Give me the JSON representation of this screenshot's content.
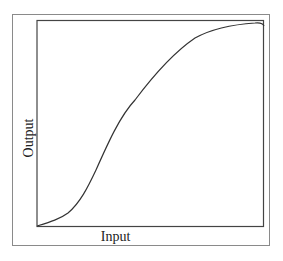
{
  "chart_data": {
    "type": "line",
    "title": "",
    "xlabel": "Input",
    "ylabel": "Output",
    "grid": false,
    "legend": null,
    "axis_ticks": false,
    "xlim": [
      0,
      1
    ],
    "ylim": [
      0,
      1
    ],
    "series": [
      {
        "name": "response",
        "x": [
          0.0,
          0.05,
          0.1,
          0.15,
          0.2,
          0.25,
          0.3,
          0.35,
          0.4,
          0.45,
          0.5,
          0.55,
          0.6,
          0.65,
          0.7,
          0.75,
          0.8,
          0.85,
          0.9,
          0.95,
          1.0
        ],
        "y": [
          0.0,
          0.03,
          0.07,
          0.14,
          0.24,
          0.35,
          0.47,
          0.58,
          0.68,
          0.75,
          0.81,
          0.86,
          0.91,
          0.94,
          0.96,
          0.97,
          0.98,
          0.985,
          0.99,
          0.995,
          0.99
        ]
      }
    ],
    "svg_path": "M37,226 C50,222 60,219 68,213 C80,203 88,187 96,170 C108,143 120,116 135,100 C150,80 170,55 195,38 C215,27 240,24 255,23 C260,22.5 263,23 264,26",
    "plot_box": {
      "x": 37,
      "y": 20,
      "width": 227,
      "height": 206
    }
  },
  "labels": {
    "x_axis": "Input",
    "y_axis": "Output"
  },
  "colors": {
    "curve": "#333333",
    "axes": "#444444",
    "frame": "#8a8a8a",
    "background": "#ffffff"
  }
}
